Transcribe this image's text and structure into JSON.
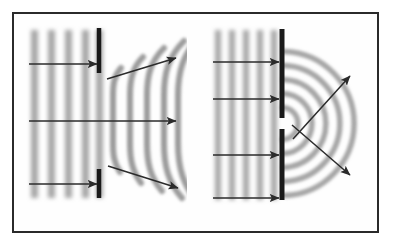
{
  "figure": {
    "background_color": "#ffffff",
    "width": 394,
    "height": 246,
    "frame": {
      "x": 13,
      "y": 13,
      "width": 365,
      "height": 219,
      "stroke_color": "#2a2a2a",
      "stroke_width": 2.0,
      "fill": "#fefefe"
    },
    "wave_color": "#a6a6a6",
    "wave_color_dark": "#8c8c8c",
    "barrier_color": "#1a1a1a",
    "arrow_color": "#2b2b2b"
  },
  "panels": [
    {
      "id": "left-panel",
      "name": "wide-gap-diffraction",
      "description": "Plane waves strike a barrier with a wide opening; waves pass mostly straight through and bend only slightly at the edges.",
      "plane_waves": {
        "x_start": 28,
        "x_end": 99,
        "y_top": 30,
        "y_bottom": 198,
        "wavelength": 17,
        "count": 5,
        "crest_x": [
          31,
          48,
          65,
          82,
          96
        ],
        "band_width": 7
      },
      "barrier": {
        "x": 99,
        "stroke_width": 4.5,
        "segments": [
          {
            "name": "upper-barrier-segment",
            "y_top": 28,
            "y_bottom": 73
          },
          {
            "name": "lower-barrier-segment",
            "y_top": 169,
            "y_bottom": 198
          }
        ],
        "gap": {
          "y_top": 73,
          "y_bottom": 169,
          "size": 96
        }
      },
      "transmitted_waves": {
        "description": "Nearly straight wavefronts that curl at the two edges of the wide opening.",
        "crest_x": [
          113,
          130,
          147,
          164,
          179
        ],
        "y_top": 30,
        "y_bottom": 198,
        "curl_radius_top": 42,
        "curl_radius_bottom": 34
      },
      "arrows": [
        {
          "name": "incident-ray-upper",
          "x1": 29,
          "y1": 64,
          "x2": 97,
          "y2": 64
        },
        {
          "name": "incident-ray-middle",
          "x1": 29,
          "y1": 121,
          "x2": 176,
          "y2": 121
        },
        {
          "name": "incident-ray-lower",
          "x1": 29,
          "y1": 184,
          "x2": 97,
          "y2": 184
        },
        {
          "name": "diffracted-ray-upper",
          "x1": 107,
          "y1": 79,
          "x2": 176,
          "y2": 58
        },
        {
          "name": "diffracted-ray-lower",
          "x1": 108,
          "y1": 166,
          "x2": 178,
          "y2": 188
        }
      ]
    },
    {
      "id": "right-panel",
      "name": "narrow-gap-diffraction",
      "description": "Plane waves strike a barrier with a narrow opening; waves spread out as circular wavefronts from the small gap.",
      "plane_waves": {
        "x_start": 212,
        "x_end": 281,
        "y_top": 30,
        "y_bottom": 200,
        "wavelength": 14,
        "count": 5,
        "crest_x": [
          215,
          229,
          243,
          257,
          271
        ],
        "band_width": 6
      },
      "barrier": {
        "x": 282,
        "stroke_width": 5.0,
        "segments": [
          {
            "name": "upper-barrier-segment",
            "y_top": 29,
            "y_bottom": 118
          },
          {
            "name": "lower-barrier-segment",
            "y_top": 129,
            "y_bottom": 200
          }
        ],
        "gap": {
          "y_top": 118,
          "y_bottom": 129,
          "size": 11,
          "center_y": 123.5
        }
      },
      "circular_waves": {
        "description": "Semicircular wavefronts radiating from the narrow slit.",
        "source_x": 282,
        "source_y": 123.5,
        "radii": [
          16,
          30,
          44,
          58,
          72
        ],
        "start_angle_deg": -88,
        "end_angle_deg": 88
      },
      "arrows": [
        {
          "name": "incident-ray-top",
          "x1": 213,
          "y1": 62,
          "x2": 279,
          "y2": 62
        },
        {
          "name": "incident-ray-upper-mid",
          "x1": 213,
          "y1": 99,
          "x2": 279,
          "y2": 99
        },
        {
          "name": "incident-ray-lower-mid",
          "x1": 213,
          "y1": 155,
          "x2": 279,
          "y2": 155
        },
        {
          "name": "incident-ray-bottom",
          "x1": 213,
          "y1": 198,
          "x2": 279,
          "y2": 198
        },
        {
          "name": "diffracted-ray-upper",
          "x1": 293,
          "y1": 139,
          "x2": 350,
          "y2": 76
        },
        {
          "name": "diffracted-ray-lower",
          "x1": 292,
          "y1": 125,
          "x2": 350,
          "y2": 175
        }
      ]
    }
  ]
}
